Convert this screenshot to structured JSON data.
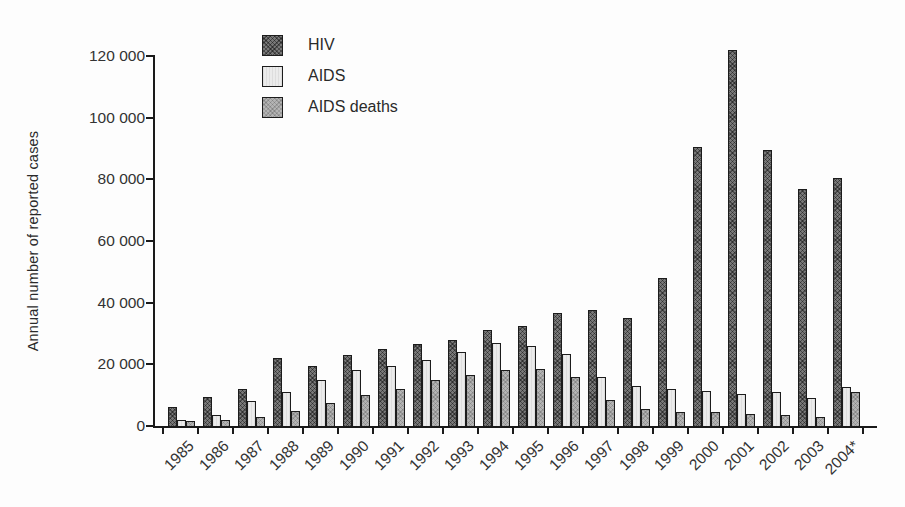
{
  "figure": {
    "ylabel": "Annual number of reported cases"
  },
  "colors": {
    "hiv": "#787878",
    "aids": "#ebebeb",
    "deaths": "#b4b4b4",
    "border": "#1c1c1c",
    "axis": "#1a1a1a",
    "background": "#fdfdfd",
    "text": "#2b2b2b"
  },
  "chart_data": {
    "type": "bar",
    "title": "",
    "xlabel": "",
    "ylabel": "Annual number of reported cases",
    "ylim": [
      0,
      120000
    ],
    "ytick_interval": 20000,
    "ytick_labels": [
      "0",
      "20 000",
      "40 000",
      "60 000",
      "80 000",
      "100 000",
      "120 000"
    ],
    "grid": false,
    "legend_position": "top-left-inside",
    "categories": [
      "1985",
      "1986",
      "1987",
      "1988",
      "1989",
      "1990",
      "1991",
      "1992",
      "1993",
      "1994",
      "1995",
      "1996",
      "1997",
      "1998",
      "1999",
      "2000",
      "2001",
      "2002",
      "2003",
      "2004*"
    ],
    "series": [
      {
        "name": "HIV",
        "key": "hiv",
        "values": [
          6000,
          9500,
          12000,
          22000,
          19500,
          23000,
          25000,
          26500,
          28000,
          31000,
          32500,
          36500,
          37500,
          35000,
          48000,
          90500,
          122000,
          89500,
          77000,
          80500
        ]
      },
      {
        "name": "AIDS",
        "key": "aids",
        "values": [
          2000,
          3500,
          8000,
          11000,
          15000,
          18000,
          19500,
          21500,
          24000,
          27000,
          26000,
          23500,
          16000,
          13000,
          12000,
          11500,
          10500,
          11000,
          9000,
          12500
        ]
      },
      {
        "name": "AIDS deaths",
        "key": "deaths",
        "values": [
          1500,
          2000,
          3000,
          5000,
          7500,
          10000,
          12000,
          15000,
          16500,
          18000,
          18500,
          16000,
          8500,
          5500,
          4500,
          4500,
          4000,
          3500,
          3000,
          11000
        ]
      }
    ]
  }
}
